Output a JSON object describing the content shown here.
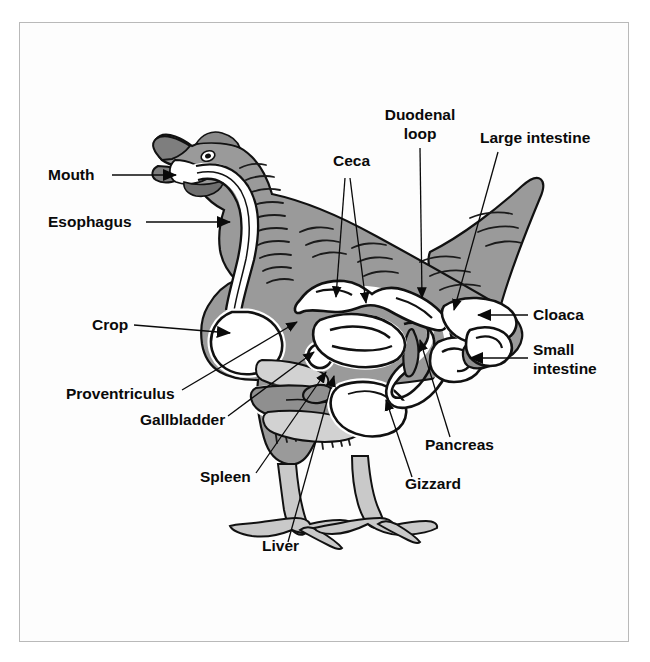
{
  "figure": {
    "style": "black-and-white line drawing with gray shading",
    "border_color": "#b9b9b9",
    "background_color": "#ffffff"
  },
  "colors": {
    "body_gray": "#9a9a9a",
    "organ_gray": "#8f8f8f",
    "organ_white": "#ffffff",
    "leg_gray": "#c9c9c9",
    "outline_black": "#111111",
    "label_black": "#0a0a0a"
  },
  "labels": [
    {
      "id": "mouth",
      "text": "Mouth",
      "x": 48,
      "y": 180,
      "anchor": "start",
      "connector": "arrow"
    },
    {
      "id": "esophagus",
      "text": "Esophagus",
      "x": 48,
      "y": 227,
      "anchor": "start",
      "connector": "arrow"
    },
    {
      "id": "crop",
      "text": "Crop",
      "x": 92,
      "y": 330,
      "anchor": "start",
      "connector": "arrow"
    },
    {
      "id": "proventriculus",
      "text": "Proventriculus",
      "x": 66,
      "y": 399,
      "anchor": "start",
      "connector": "arrow"
    },
    {
      "id": "gallbladder",
      "text": "Gallbladder",
      "x": 140,
      "y": 425,
      "anchor": "start",
      "connector": "arrow"
    },
    {
      "id": "spleen",
      "text": "Spleen",
      "x": 200,
      "y": 482,
      "anchor": "start",
      "connector": "arrow"
    },
    {
      "id": "liver",
      "text": "Liver",
      "x": 262,
      "y": 551,
      "anchor": "start",
      "connector": "arrow"
    },
    {
      "id": "ceca",
      "text": "Ceca",
      "x": 333,
      "y": 166,
      "anchor": "start",
      "connector": "arrow"
    },
    {
      "id": "duodenal-loop-1",
      "text": "Duodenal",
      "x": 420,
      "y": 120,
      "anchor": "middle",
      "connector": "none"
    },
    {
      "id": "duodenal-loop-2",
      "text": "loop",
      "x": 420,
      "y": 139,
      "anchor": "middle",
      "connector": "arrow"
    },
    {
      "id": "large-intestine",
      "text": "Large intestine",
      "x": 480,
      "y": 143,
      "anchor": "start",
      "connector": "arrow"
    },
    {
      "id": "cloaca",
      "text": "Cloaca",
      "x": 533,
      "y": 320,
      "anchor": "start",
      "connector": "arrow"
    },
    {
      "id": "small-1",
      "text": "Small",
      "x": 533,
      "y": 355,
      "anchor": "start",
      "connector": "arrow"
    },
    {
      "id": "small-2",
      "text": "intestine",
      "x": 533,
      "y": 374,
      "anchor": "start",
      "connector": "none"
    },
    {
      "id": "pancreas",
      "text": "Pancreas",
      "x": 425,
      "y": 450,
      "anchor": "start",
      "connector": "arrow"
    },
    {
      "id": "gizzard",
      "text": "Gizzard",
      "x": 405,
      "y": 489,
      "anchor": "start",
      "connector": "arrow"
    }
  ],
  "organ_list": [
    "Mouth",
    "Esophagus",
    "Crop",
    "Proventriculus",
    "Gizzard",
    "Liver",
    "Gallbladder",
    "Spleen",
    "Pancreas",
    "Duodenal loop",
    "Small intestine",
    "Ceca",
    "Large intestine",
    "Cloaca"
  ]
}
